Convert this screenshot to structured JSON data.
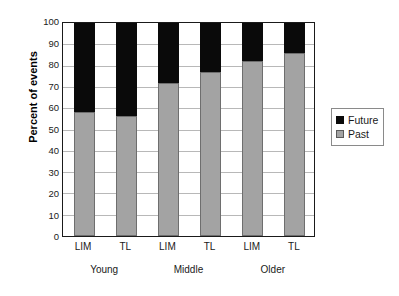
{
  "chart_data": {
    "type": "bar",
    "subtype": "stacked-bar-100-percent",
    "title": "",
    "subtitle": "",
    "xlabel": "",
    "ylabel": "Percent of events",
    "ylim": [
      0,
      100
    ],
    "ytick_step": 10,
    "yticks": [
      100,
      90,
      80,
      70,
      60,
      50,
      40,
      30,
      20,
      10,
      0
    ],
    "grid": "horizontal",
    "legend_position": "right",
    "categories": [
      "LIM",
      "TL",
      "LIM",
      "TL",
      "LIM",
      "TL"
    ],
    "groups": [
      {
        "label": "Young",
        "categories": [
          "LIM",
          "TL"
        ]
      },
      {
        "label": "Middle",
        "categories": [
          "LIM",
          "TL"
        ]
      },
      {
        "label": "Older",
        "categories": [
          "LIM",
          "TL"
        ]
      }
    ],
    "series": [
      {
        "name": "Past",
        "color": "#a3a3a3",
        "values": [
          58,
          56.5,
          72,
          77,
          82,
          86
        ]
      },
      {
        "name": "Future",
        "color": "#0a0a0a",
        "values": [
          42,
          43.5,
          28,
          23,
          18,
          14
        ]
      }
    ],
    "bars": [
      {
        "group": "Young",
        "category": "LIM",
        "past": 58,
        "future": 42
      },
      {
        "group": "Young",
        "category": "TL",
        "past": 56.5,
        "future": 43.5
      },
      {
        "group": "Middle",
        "category": "LIM",
        "past": 72,
        "future": 28
      },
      {
        "group": "Middle",
        "category": "TL",
        "past": 77,
        "future": 23
      },
      {
        "group": "Older",
        "category": "LIM",
        "past": 82,
        "future": 18
      },
      {
        "group": "Older",
        "category": "TL",
        "past": 86,
        "future": 14
      }
    ],
    "legend": [
      {
        "label": "Future",
        "color": "#0a0a0a"
      },
      {
        "label": "Past",
        "color": "#a3a3a3"
      }
    ]
  },
  "axis": {
    "y_title": "Percent of events",
    "y_ticks": [
      "100",
      "90",
      "80",
      "70",
      "60",
      "50",
      "40",
      "30",
      "20",
      "10",
      "0"
    ],
    "x_ticks": [
      "LIM",
      "TL",
      "LIM",
      "TL",
      "LIM",
      "TL"
    ],
    "group_labels": [
      "Young",
      "Middle",
      "Older"
    ]
  },
  "legend": {
    "future_label": "Future",
    "past_label": "Past"
  },
  "colors": {
    "future": "#0a0a0a",
    "past": "#a3a3a3",
    "axis": "#1a1a1a",
    "grid": "#b8b8b8",
    "background": "#ffffff"
  }
}
